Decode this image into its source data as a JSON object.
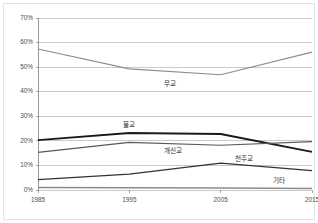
{
  "chart_data": {
    "type": "line",
    "title": "",
    "subtitle": "",
    "xlabel": "",
    "ylabel": "",
    "categories": [
      "1985",
      "1995",
      "2005",
      "2015"
    ],
    "x": [
      1985,
      1995,
      2005,
      2015
    ],
    "xlim": [
      1985,
      2015
    ],
    "ylim": [
      0,
      70
    ],
    "y_tick_labels": [
      "0%",
      "10%",
      "20%",
      "30%",
      "40%",
      "50%",
      "60%",
      "70%"
    ],
    "y_tick_values": [
      0,
      10,
      20,
      30,
      40,
      50,
      60,
      70
    ],
    "grid": "horizontal",
    "legend": "inline-series-labels",
    "series": [
      {
        "name": "무교",
        "label": "무교",
        "color": "#8c8c8c",
        "stroke_width": 1.1,
        "values": [
          57.4,
          49.3,
          46.9,
          56.1
        ],
        "label_x": 1999.4,
        "label_y": 43.2
      },
      {
        "name": "불교",
        "label": "불교",
        "color": "#1a1a1a",
        "stroke_width": 1.9,
        "values": [
          20.3,
          23.2,
          22.8,
          15.5
        ],
        "label_x": 1995.0,
        "label_y": 26.4
      },
      {
        "name": "개신교",
        "label": "개신교",
        "color": "#595959",
        "stroke_width": 1.1,
        "values": [
          15.3,
          19.4,
          18.2,
          19.7
        ],
        "label_x": 1999.8,
        "label_y": 15.6
      },
      {
        "name": "천주교",
        "label": "천주교",
        "color": "#333333",
        "stroke_width": 1.3,
        "values": [
          4.2,
          6.5,
          10.9,
          7.9
        ],
        "label_x": 2007.6,
        "label_y": 12.4
      },
      {
        "name": "기타",
        "label": "기타",
        "color": "#8c8c8c",
        "stroke_width": 1.5,
        "values": [
          1.0,
          0.9,
          0.8,
          0.6
        ],
        "label_x": 2011.4,
        "label_y": 3.4
      }
    ]
  },
  "axes": {
    "y_ticks": [
      {
        "label": "70%",
        "value": 70
      },
      {
        "label": "60%",
        "value": 60
      },
      {
        "label": "50%",
        "value": 50
      },
      {
        "label": "40%",
        "value": 40
      },
      {
        "label": "30%",
        "value": 30
      },
      {
        "label": "20%",
        "value": 20
      },
      {
        "label": "10%",
        "value": 10
      },
      {
        "label": "0%",
        "value": 0
      }
    ],
    "x_ticks": [
      {
        "label": "1985",
        "value": 1985
      },
      {
        "label": "1995",
        "value": 1995
      },
      {
        "label": "2005",
        "value": 2005
      },
      {
        "label": "2015",
        "value": 2015
      }
    ]
  },
  "colors": {
    "background": "#ffffff",
    "gridline": "#a6a6a6",
    "axis": "#808080",
    "tick_text": "#4d4d4d",
    "label_text": "#2b2b2b",
    "frame": "#d9d9d9"
  }
}
